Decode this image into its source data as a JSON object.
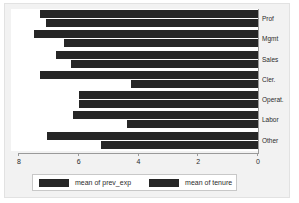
{
  "chart_data": {
    "type": "bar",
    "orientation": "horizontal",
    "title": "",
    "subtitle": "",
    "xlabel": "",
    "ylabel": "",
    "categories": [
      "Prof",
      "Mgmt",
      "Sales",
      "Cler.",
      "Operat.",
      "Labor",
      "Other"
    ],
    "series": [
      {
        "name": "mean of prev_exp",
        "color": "#262626",
        "values": [
          7.3,
          7.5,
          6.75,
          7.3,
          6.0,
          6.2,
          7.05
        ]
      },
      {
        "name": "mean of tenure",
        "color": "#262626",
        "values": [
          7.1,
          6.5,
          6.25,
          4.25,
          6.0,
          4.4,
          5.25
        ]
      }
    ],
    "xticks": [
      "8",
      "6",
      "4",
      "2",
      "0"
    ],
    "xtickvalues": [
      8,
      6,
      4,
      2,
      0
    ],
    "xlim": [
      8,
      0
    ],
    "axis_reversed": true,
    "grid": false,
    "legend_position": "bottom",
    "legend_entries": [
      "mean of prev_exp",
      "mean of tenure"
    ]
  },
  "colors": {
    "bar": "#262626",
    "panel": "#f2f2f2",
    "plot_background": "#ffffff",
    "axis": "#9a9a9a",
    "text": "#2b2b2b"
  }
}
